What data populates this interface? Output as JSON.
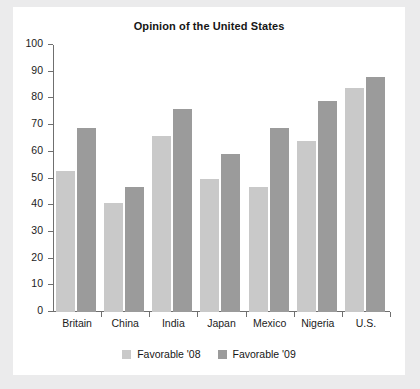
{
  "chart_data": {
    "type": "bar",
    "title": "Opinion of the United States",
    "xlabel": "",
    "ylabel": "",
    "ylim": [
      0,
      100
    ],
    "yticks": [
      0,
      10,
      20,
      30,
      40,
      50,
      60,
      70,
      80,
      90,
      100
    ],
    "grid": false,
    "legend_position": "bottom",
    "categories": [
      "Britain",
      "China",
      "India",
      "Japan",
      "Mexico",
      "Nigeria",
      "U.S."
    ],
    "series": [
      {
        "name": "Favorable '08",
        "color": "#c9c9c9",
        "values": [
          53,
          41,
          66,
          50,
          47,
          64,
          84
        ]
      },
      {
        "name": "Favorable '09",
        "color": "#9b9b9b",
        "values": [
          69,
          47,
          76,
          59,
          69,
          79,
          88
        ]
      }
    ]
  }
}
